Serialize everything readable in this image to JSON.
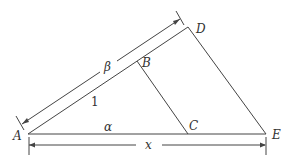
{
  "diagram": {
    "type": "similar-triangles",
    "colors": {
      "stroke": "#444444",
      "text": "#333333",
      "background": "#ffffff"
    },
    "points": {
      "A": {
        "label": "A",
        "x": 28,
        "y": 134
      },
      "B": {
        "label": "B",
        "x": 137,
        "y": 61
      },
      "C": {
        "label": "C",
        "x": 188,
        "y": 134
      },
      "D": {
        "label": "D",
        "x": 188,
        "y": 27
      },
      "E": {
        "label": "E",
        "x": 266,
        "y": 134
      }
    },
    "segments": [
      {
        "from": "A",
        "to": "D"
      },
      {
        "from": "A",
        "to": "E"
      },
      {
        "from": "D",
        "to": "E"
      },
      {
        "from": "B",
        "to": "C"
      }
    ],
    "labels": {
      "ab_length": "1",
      "ac_length": "α",
      "ad_length": "β",
      "ae_length": "x"
    },
    "dimensions": [
      {
        "name": "beta-dimension",
        "label": "β",
        "from": "A",
        "to": "D"
      },
      {
        "name": "x-dimension",
        "label": "x",
        "from": "A",
        "to": "E"
      }
    ]
  }
}
